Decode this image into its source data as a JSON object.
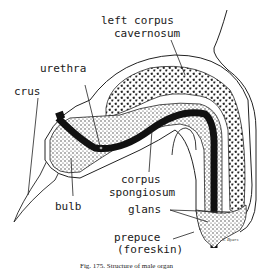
{
  "diagram": {
    "type": "anatomical-section",
    "labels": {
      "left_corpus_cavernosum": [
        "left corpus",
        "cavernosum"
      ],
      "urethra": "urethra",
      "crus": "crus",
      "corpus_spongiosum": [
        "corpus",
        "spongiosum"
      ],
      "bulb": "bulb",
      "glans": "glans",
      "prepuce": [
        "prepuce",
        "(foreskin)"
      ]
    },
    "signature": "S. Byers",
    "caption": "Fig. 175. Structure of male organ"
  }
}
